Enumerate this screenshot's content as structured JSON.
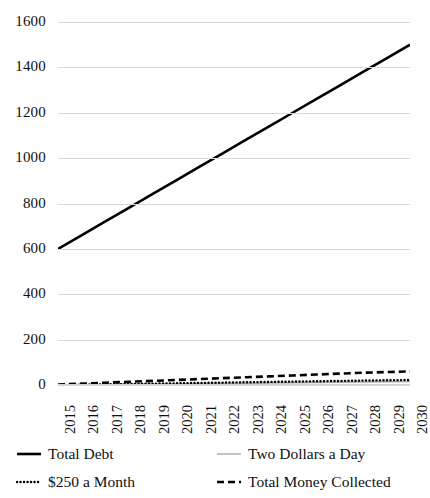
{
  "chart_data": {
    "type": "line",
    "title": "",
    "xlabel": "",
    "ylabel": "",
    "x": [
      2015,
      2016,
      2017,
      2018,
      2019,
      2020,
      2021,
      2022,
      2023,
      2024,
      2025,
      2026,
      2027,
      2028,
      2029,
      2030
    ],
    "categories": [
      "2015",
      "2016",
      "2017",
      "2018",
      "2019",
      "2020",
      "2021",
      "2022",
      "2023",
      "2024",
      "2025",
      "2026",
      "2027",
      "2028",
      "2029",
      "2030"
    ],
    "ylim": [
      0,
      1600
    ],
    "yticks": [
      0,
      200,
      400,
      600,
      800,
      1000,
      1200,
      1400,
      1600
    ],
    "ytick_labels": [
      "0",
      "200",
      "400",
      "600",
      "800",
      "1000",
      "1200",
      "1400",
      "1600"
    ],
    "grid": "horizontal",
    "legend_position": "bottom",
    "series": [
      {
        "name": "Total Debt",
        "style": "solid-thick",
        "color": "#000000",
        "values": [
          600,
          660,
          720,
          780,
          840,
          900,
          960,
          1020,
          1080,
          1140,
          1200,
          1260,
          1320,
          1380,
          1440,
          1500
        ]
      },
      {
        "name": "Two Dollars a Day",
        "style": "solid-thin",
        "color": "#a6a6a6",
        "values": [
          0,
          1,
          2,
          3,
          4,
          5,
          6,
          7,
          8,
          9,
          10,
          11,
          12,
          13,
          14,
          15
        ]
      },
      {
        "name": "$250 a Month",
        "style": "dotted",
        "color": "#000000",
        "values": [
          0,
          1.5,
          3,
          4.5,
          6,
          7.5,
          9,
          10.5,
          12,
          13.5,
          15,
          16.5,
          18,
          19.5,
          21,
          22
        ]
      },
      {
        "name": "Total Money Collected",
        "style": "dashed",
        "color": "#000000",
        "values": [
          2,
          6,
          10,
          14,
          18,
          22,
          26,
          30,
          34,
          38,
          42,
          46,
          50,
          54,
          57,
          60
        ]
      }
    ]
  },
  "legend": {
    "items": [
      {
        "label": "Total Debt",
        "swatch": "solid-thick-line-icon"
      },
      {
        "label": "Two Dollars a Day",
        "swatch": "solid-thin-line-icon"
      },
      {
        "label": "$250 a Month",
        "swatch": "dotted-line-icon"
      },
      {
        "label": "Total Money Collected",
        "swatch": "dashed-line-icon"
      }
    ]
  }
}
